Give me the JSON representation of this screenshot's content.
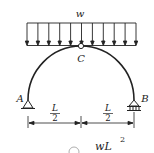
{
  "diagram": {
    "type": "three-hinged semicircular arch under uniform load",
    "load_label": "w",
    "hinge_label": "C",
    "support_left_label": "A",
    "support_right_label": "B",
    "dimension_left": {
      "numerator": "L",
      "denominator": "2"
    },
    "dimension_right": {
      "numerator": "L",
      "denominator": "2"
    },
    "arrow_count": 11,
    "colors": {
      "line": "#222222",
      "background": "#ffffff"
    }
  },
  "answer_fragment": {
    "option_symbol": "③",
    "expression_base": "wL",
    "expression_exp": "2"
  }
}
